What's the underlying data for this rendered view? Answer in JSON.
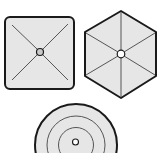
{
  "colors": {
    "background": "#ffffff",
    "fill": "#e6e6e6",
    "outline": "#1a1a1a",
    "inner_line": "#555555",
    "center_dot_fill": "#c8c8c8"
  },
  "shapes": [
    {
      "name": "square-shape",
      "type": "rounded-square",
      "spokes": 4,
      "center_marker": "circle"
    },
    {
      "name": "hexagon-shape",
      "type": "hexagon",
      "spokes": 6,
      "center_marker": "circle"
    },
    {
      "name": "circle-shape",
      "type": "concentric-circles",
      "rings": 3,
      "center_marker": "circle"
    }
  ]
}
